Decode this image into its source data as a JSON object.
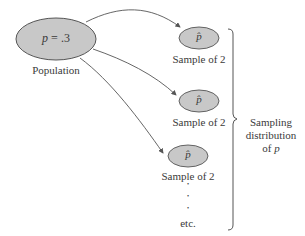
{
  "population": {
    "label_var": "p",
    "label_eq": " = .3",
    "caption": "Population",
    "fill": "#c8c8c8"
  },
  "samples": [
    {
      "symbol": "p̂",
      "caption": "Sample of 2"
    },
    {
      "symbol": "p̂",
      "caption": "Sample of 2"
    },
    {
      "symbol": "p̂",
      "caption": "Sample of 2"
    }
  ],
  "continuation": {
    "dots": [
      "•",
      "•",
      "•"
    ],
    "caption": "etc."
  },
  "brace_label": {
    "line1": "Sampling",
    "line2": "distribution",
    "line3_prefix": "of ",
    "line3_var": "p"
  },
  "colors": {
    "ellipse_fill": "#c8c8c8",
    "stroke": "#555555",
    "text": "#3a3a3a"
  }
}
